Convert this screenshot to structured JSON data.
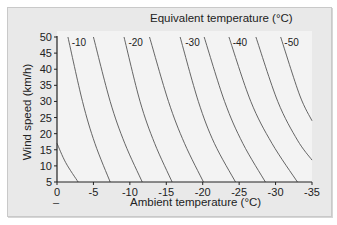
{
  "chart_data": {
    "type": "line",
    "title": "Equivalent temperature (°C)",
    "xlabel": "Ambient temperature (°C)",
    "ylabel": "Wind speed (km/h)",
    "xlim": [
      0,
      -35
    ],
    "ylim": [
      5,
      50
    ],
    "x_ticks": [
      "0",
      "-5",
      "-10",
      "-15",
      "-20",
      "-25",
      "-30",
      "-35"
    ],
    "y_ticks": [
      "5",
      "10",
      "15",
      "20",
      "25",
      "30",
      "35",
      "40",
      "45",
      "50"
    ],
    "grid": false,
    "legend": "none",
    "curve_labels": [
      "-10",
      "-20",
      "-30",
      "-40",
      "-50"
    ],
    "extra_mark": "–",
    "series": [
      {
        "name": "-5",
        "points": [
          [
            0,
            17
          ],
          [
            -1.2,
            11
          ],
          [
            -2.9,
            5
          ]
        ]
      },
      {
        "name": "-10",
        "points": [
          [
            -1.5,
            50
          ],
          [
            -3.5,
            30
          ],
          [
            -5.2,
            17
          ],
          [
            -7.3,
            5
          ]
        ]
      },
      {
        "name": "-15",
        "points": [
          [
            -5.0,
            50
          ],
          [
            -7.3,
            30
          ],
          [
            -9.3,
            17
          ],
          [
            -11.7,
            5
          ]
        ]
      },
      {
        "name": "-20",
        "points": [
          [
            -9.2,
            50
          ],
          [
            -11.4,
            30
          ],
          [
            -13.4,
            17
          ],
          [
            -15.8,
            5
          ]
        ]
      },
      {
        "name": "-25",
        "points": [
          [
            -12.7,
            50
          ],
          [
            -15.3,
            30
          ],
          [
            -17.5,
            17
          ],
          [
            -20.1,
            5
          ]
        ]
      },
      {
        "name": "-30",
        "points": [
          [
            -16.9,
            50
          ],
          [
            -19.4,
            30
          ],
          [
            -21.6,
            17
          ],
          [
            -24.5,
            5
          ]
        ]
      },
      {
        "name": "-35",
        "points": [
          [
            -20.2,
            50
          ],
          [
            -23.0,
            30
          ],
          [
            -25.5,
            17
          ],
          [
            -28.6,
            5
          ]
        ]
      },
      {
        "name": "-40",
        "points": [
          [
            -23.6,
            50
          ],
          [
            -26.6,
            30
          ],
          [
            -29.5,
            17
          ],
          [
            -33.0,
            5
          ]
        ]
      },
      {
        "name": "-45",
        "points": [
          [
            -27.3,
            50
          ],
          [
            -30.3,
            30
          ],
          [
            -33.0,
            18
          ],
          [
            -35.0,
            11.8
          ]
        ]
      },
      {
        "name": "-50",
        "points": [
          [
            -30.7,
            50
          ],
          [
            -33.3,
            32
          ],
          [
            -35.0,
            24
          ]
        ]
      }
    ]
  }
}
